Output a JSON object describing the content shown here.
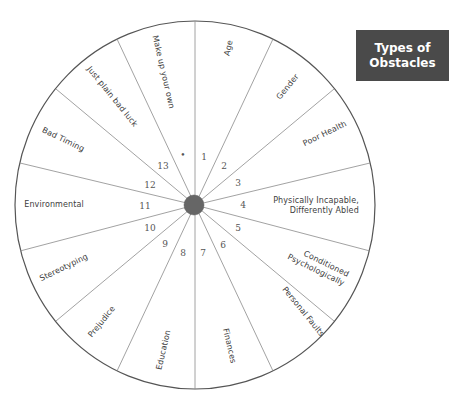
{
  "title": {
    "line1": "Types of",
    "line2": "Obstacles"
  },
  "wheel": {
    "center": [
      195,
      205
    ],
    "radius_x": 180,
    "radius_y": 184,
    "hub_radius": 10,
    "hub_color": "#666666",
    "sector_count": 14,
    "sectors": [
      {
        "number": "1",
        "label": "Age"
      },
      {
        "number": "2",
        "label": "Gender"
      },
      {
        "number": "3",
        "label": "Poor Health"
      },
      {
        "number": "4",
        "label_line1": "Physically Incapable,",
        "label_line2": "Differently Abled"
      },
      {
        "number": "5",
        "label_line1": "Conditioned",
        "label_line2": "Psychologically"
      },
      {
        "number": "6",
        "label": "Personal Faults"
      },
      {
        "number": "7",
        "label": "Finances"
      },
      {
        "number": "8",
        "label": "Education"
      },
      {
        "number": "9",
        "label": "Prejudice"
      },
      {
        "number": "10",
        "label": "Stereotyping"
      },
      {
        "number": "11",
        "label": "Environmental"
      },
      {
        "number": "12",
        "label": "Bad Timing"
      },
      {
        "number": "13",
        "label": "Just plain bad luck"
      },
      {
        "number": "•",
        "label": "Make up your own"
      }
    ]
  }
}
